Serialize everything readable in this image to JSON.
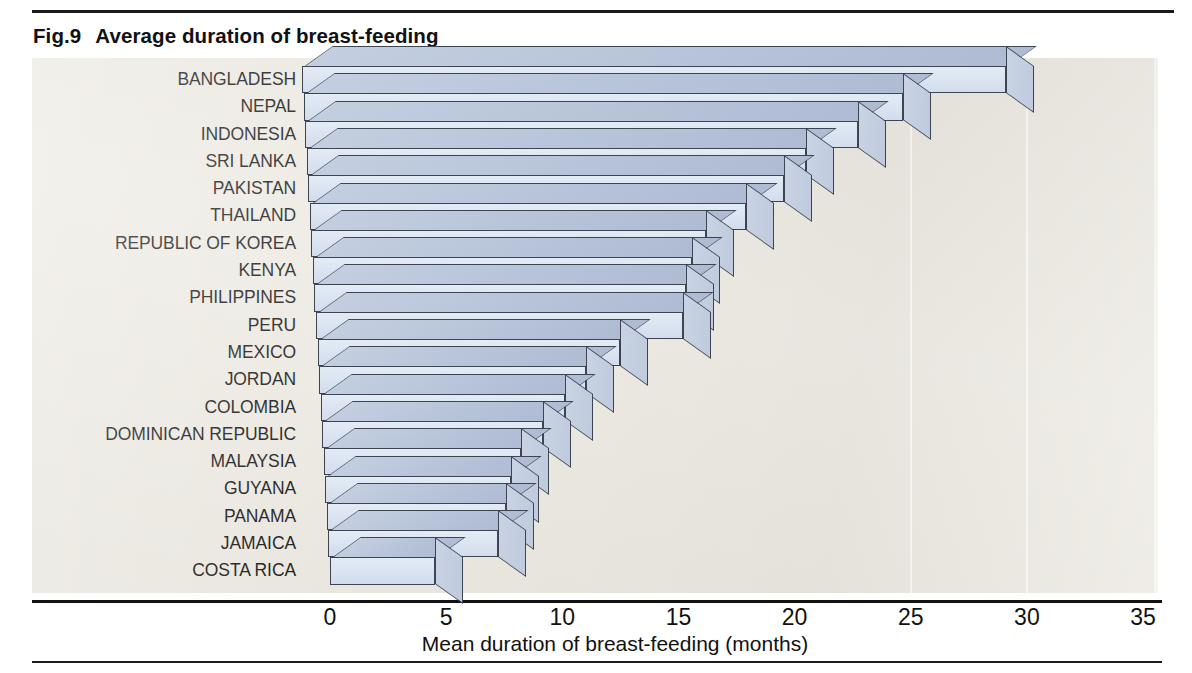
{
  "figure": {
    "number": "Fig.9",
    "title": "Average duration of breast-feeding"
  },
  "colors": {
    "bar_face": "#dae3f0",
    "bar_top": "#b6c2d8",
    "bar_outline": "#3d4452",
    "plot_background": "#ece9e1",
    "gridline": "#fbfaf7",
    "text": "#111111"
  },
  "chart_data": {
    "type": "bar",
    "orientation": "horizontal",
    "title": "Average duration of breast-feeding",
    "xlabel": "Mean duration of breast-feeding (months)",
    "ylabel": "",
    "xlim": [
      0,
      35
    ],
    "xticks": [
      0,
      5,
      10,
      15,
      20,
      25,
      30,
      35
    ],
    "xtick_labels": [
      "0",
      "5",
      "10",
      "15",
      "20",
      "25",
      "30",
      "35"
    ],
    "grid": "vertical-white",
    "legend": "none",
    "three_d": true,
    "categories": [
      "BANGLADESH",
      "NEPAL",
      "INDONESIA",
      "SRI LANKA",
      "PAKISTAN",
      "THAILAND",
      "REPUBLIC OF KOREA",
      "KENYA",
      "PHILIPPINES",
      "PERU",
      "MEXICO",
      "JORDAN",
      "COLOMBIA",
      "DOMINICAN REPUBLIC",
      "MALAYSIA",
      "GUYANA",
      "PANAMA",
      "JAMAICA",
      "COSTA RICA"
    ],
    "values": [
      30.3,
      25.8,
      23.8,
      21.5,
      20.5,
      18.8,
      17.0,
      16.3,
      16.0,
      15.8,
      13.0,
      11.5,
      10.5,
      9.5,
      8.5,
      8.0,
      7.7,
      7.3,
      4.5
    ],
    "units": "months"
  }
}
